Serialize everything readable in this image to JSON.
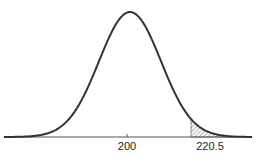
{
  "chart_data": {
    "type": "area",
    "title": "",
    "xlabel": "",
    "ylabel": "",
    "distribution": "normal",
    "mean": 200,
    "tick_labels": [
      "200",
      "220.5"
    ],
    "ticks": [
      200,
      220.5
    ],
    "shaded_region": {
      "from": 220.5,
      "to": "infinity",
      "pattern": "diagonal-hatch"
    },
    "grid": false,
    "legend": null
  },
  "colors": {
    "curve": "#333333",
    "axis": "#555555",
    "hatch": "#444444"
  }
}
